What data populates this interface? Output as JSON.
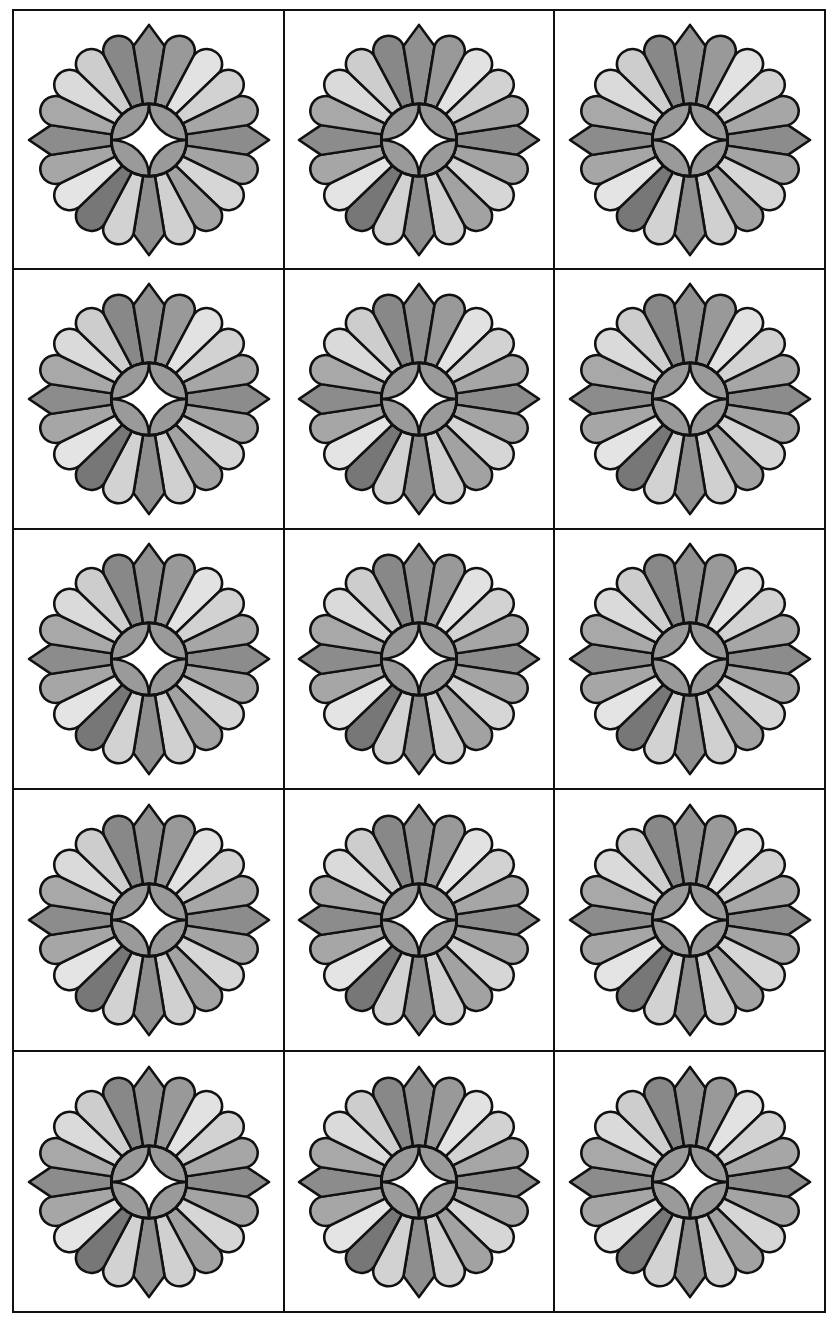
{
  "grid": {
    "rows": 5,
    "cols": 3
  },
  "colors": {
    "outline": "#111111",
    "background": "#ffffff",
    "center_lens": "#9a9a9a",
    "center_star": "#ffffff"
  },
  "flower": {
    "petal_count": 20,
    "pointed_petal_angles": [
      0,
      90,
      180,
      270
    ],
    "petal_colors": [
      "#8c8c8c",
      "#a4a4a4",
      "#d6d6d6",
      "#a2a2a2",
      "#d0d0d0",
      "#8e8e8e",
      "#d2d2d2",
      "#777777",
      "#e4e4e4",
      "#a6a6a6",
      "#8c8c8c",
      "#a8a8a8",
      "#dadada",
      "#cdcdcd",
      "#888888",
      "#909090",
      "#999999",
      "#e2e2e2",
      "#d2d2d2",
      "#a6a6a6"
    ]
  },
  "tiles": [
    {
      "row": 1,
      "col": 1
    },
    {
      "row": 1,
      "col": 2
    },
    {
      "row": 1,
      "col": 3
    },
    {
      "row": 2,
      "col": 1
    },
    {
      "row": 2,
      "col": 2
    },
    {
      "row": 2,
      "col": 3
    },
    {
      "row": 3,
      "col": 1
    },
    {
      "row": 3,
      "col": 2
    },
    {
      "row": 3,
      "col": 3
    },
    {
      "row": 4,
      "col": 1
    },
    {
      "row": 4,
      "col": 2
    },
    {
      "row": 4,
      "col": 3
    },
    {
      "row": 5,
      "col": 1
    },
    {
      "row": 5,
      "col": 2
    },
    {
      "row": 5,
      "col": 3
    }
  ]
}
